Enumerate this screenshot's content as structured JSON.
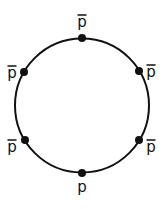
{
  "diagram": {
    "circle": {
      "cx": 82,
      "cy": 105.5,
      "r": 67,
      "stroke": "#111111",
      "stroke_width": 2
    },
    "nodes": [
      {
        "id": "top",
        "x": 82,
        "y": 38,
        "label": "p",
        "bar": true,
        "lx": 82,
        "ly": 27
      },
      {
        "id": "upper-right",
        "x": 139,
        "y": 71,
        "label": "p",
        "bar": true,
        "lx": 151,
        "ly": 77
      },
      {
        "id": "lower-right",
        "x": 139,
        "y": 140,
        "label": "p",
        "bar": true,
        "lx": 151,
        "ly": 152
      },
      {
        "id": "bottom",
        "x": 82,
        "y": 173,
        "label": "p",
        "bar": false,
        "lx": 82,
        "ly": 192
      },
      {
        "id": "lower-left",
        "x": 25,
        "y": 140,
        "label": "p",
        "bar": true,
        "lx": 12,
        "ly": 152
      },
      {
        "id": "upper-left",
        "x": 24,
        "y": 72,
        "label": "p",
        "bar": true,
        "lx": 12,
        "ly": 78
      }
    ],
    "node_radius": 4,
    "color": "#111111"
  }
}
